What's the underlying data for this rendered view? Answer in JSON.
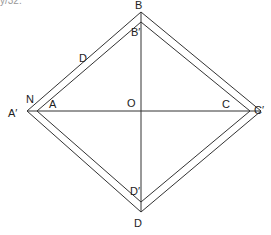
{
  "diagram": {
    "corner_text": "y/32.",
    "labels": {
      "B": "B",
      "B_prime": "B′",
      "D_upper": "D",
      "N": "N",
      "A_prime": "A′",
      "A": "A",
      "O": "O",
      "C": "C",
      "C_prime": "C′",
      "D_prime": "D′",
      "D": "D"
    },
    "points": {
      "B": [
        141,
        12
      ],
      "B_prime": [
        141,
        22
      ],
      "A_prime": [
        27,
        111
      ],
      "A": [
        37,
        111
      ],
      "O": [
        141,
        111
      ],
      "C": [
        250,
        111
      ],
      "C_prime": [
        261,
        111
      ],
      "D_prime": [
        141,
        202
      ],
      "D": [
        141,
        212
      ]
    },
    "line_color": "#333333"
  }
}
